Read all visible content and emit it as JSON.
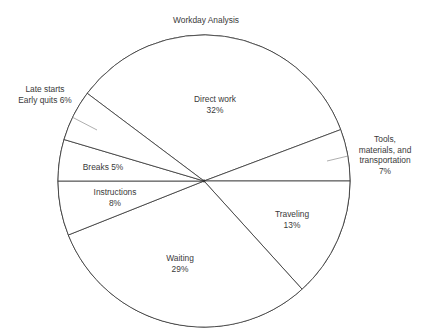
{
  "chart_data": {
    "type": "pie",
    "title": "Workday Analysis",
    "slices": [
      {
        "label": "Direct work",
        "value": 32,
        "label_lines": [
          "Direct work",
          "32%"
        ]
      },
      {
        "label": "Tools, materials, and transportation",
        "value": 7,
        "label_lines": [
          "Tools,",
          "materials, and",
          "transportation",
          "7%"
        ]
      },
      {
        "label": "Traveling",
        "value": 13,
        "label_lines": [
          "Traveling",
          "13%"
        ]
      },
      {
        "label": "Waiting",
        "value": 29,
        "label_lines": [
          "Waiting",
          "29%"
        ]
      },
      {
        "label": "Instructions",
        "value": 8,
        "label_lines": [
          "Instructions",
          "8%"
        ]
      },
      {
        "label": "Breaks",
        "value": 5,
        "label_lines": [
          "Breaks 5%"
        ]
      },
      {
        "label": "Late starts / Early quits",
        "value": 6,
        "label_lines": [
          "Late starts",
          "Early quits 6%"
        ]
      }
    ],
    "colors": {
      "stroke": "#333333",
      "fill": "#ffffff",
      "text": "#3a3a3a"
    },
    "legend": "none"
  }
}
